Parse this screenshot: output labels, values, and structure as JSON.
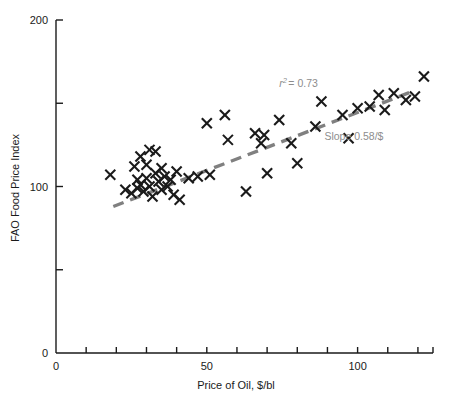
{
  "chart_data": {
    "type": "scatter",
    "title": "",
    "xlabel": "Price of Oil, $/bl",
    "ylabel": "FAO Food Price Index",
    "xlim": [
      0,
      125
    ],
    "ylim": [
      0,
      200
    ],
    "grid": false,
    "legend": null,
    "x_ticks_major": [
      0,
      50,
      100
    ],
    "x_ticks_minor": [
      10,
      20,
      30,
      40,
      60,
      70,
      80,
      90,
      110,
      120
    ],
    "x_tick_labels": [
      "0",
      "50",
      "100"
    ],
    "y_ticks_major": [
      0,
      100,
      200
    ],
    "y_ticks_minor": [
      50,
      150
    ],
    "y_tick_labels": [
      "0",
      "100",
      "200"
    ],
    "marker": "x",
    "marker_color": "#1a1a1a",
    "points": [
      {
        "x": 18,
        "y": 107
      },
      {
        "x": 23,
        "y": 98
      },
      {
        "x": 25,
        "y": 96
      },
      {
        "x": 26,
        "y": 112
      },
      {
        "x": 27,
        "y": 104
      },
      {
        "x": 27,
        "y": 99
      },
      {
        "x": 28,
        "y": 118
      },
      {
        "x": 28,
        "y": 101
      },
      {
        "x": 29,
        "y": 97
      },
      {
        "x": 30,
        "y": 113
      },
      {
        "x": 30,
        "y": 105
      },
      {
        "x": 31,
        "y": 122
      },
      {
        "x": 31,
        "y": 100
      },
      {
        "x": 32,
        "y": 94
      },
      {
        "x": 33,
        "y": 121
      },
      {
        "x": 33,
        "y": 108
      },
      {
        "x": 34,
        "y": 103
      },
      {
        "x": 35,
        "y": 111
      },
      {
        "x": 35,
        "y": 98
      },
      {
        "x": 36,
        "y": 106
      },
      {
        "x": 37,
        "y": 100
      },
      {
        "x": 38,
        "y": 104
      },
      {
        "x": 39,
        "y": 95
      },
      {
        "x": 40,
        "y": 109
      },
      {
        "x": 41,
        "y": 92
      },
      {
        "x": 44,
        "y": 105
      },
      {
        "x": 47,
        "y": 106
      },
      {
        "x": 50,
        "y": 138
      },
      {
        "x": 51,
        "y": 107
      },
      {
        "x": 56,
        "y": 143
      },
      {
        "x": 57,
        "y": 128
      },
      {
        "x": 63,
        "y": 97
      },
      {
        "x": 66,
        "y": 132
      },
      {
        "x": 68,
        "y": 126
      },
      {
        "x": 69,
        "y": 131
      },
      {
        "x": 70,
        "y": 108
      },
      {
        "x": 74,
        "y": 140
      },
      {
        "x": 78,
        "y": 126
      },
      {
        "x": 80,
        "y": 114
      },
      {
        "x": 86,
        "y": 136
      },
      {
        "x": 88,
        "y": 151
      },
      {
        "x": 95,
        "y": 143
      },
      {
        "x": 97,
        "y": 129
      },
      {
        "x": 100,
        "y": 147
      },
      {
        "x": 104,
        "y": 148
      },
      {
        "x": 107,
        "y": 155
      },
      {
        "x": 109,
        "y": 146
      },
      {
        "x": 112,
        "y": 156
      },
      {
        "x": 116,
        "y": 152
      },
      {
        "x": 119,
        "y": 154
      },
      {
        "x": 122,
        "y": 166
      }
    ],
    "trendline": {
      "style": "dashed",
      "color": "#808080",
      "x_start": 19,
      "y_start": 88,
      "x_end": 118,
      "y_end": 157
    },
    "annotations": {
      "r_squared_prefix": "r",
      "r_squared_exponent": "2",
      "r_squared_value": "= 0.73",
      "r_squared_x": 74,
      "r_squared_y": 160,
      "slope_text": "Slope 0.58/$",
      "slope_x": 89,
      "slope_y": 128
    }
  }
}
